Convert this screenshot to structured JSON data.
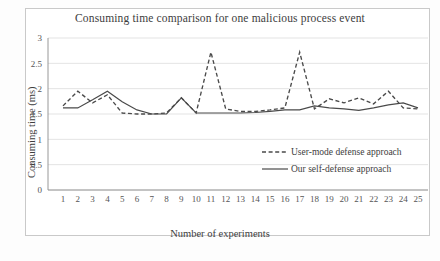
{
  "chart_data": {
    "type": "line",
    "title": "Consuming time comparison for one malicious process event",
    "xlabel": "Number of experiments",
    "ylabel": "Consuming time (ms)",
    "x": [
      1,
      2,
      3,
      4,
      5,
      6,
      7,
      8,
      9,
      10,
      11,
      12,
      13,
      14,
      15,
      16,
      17,
      18,
      19,
      20,
      21,
      22,
      23,
      24,
      25
    ],
    "xticklabels": [
      "1",
      "2",
      "3",
      "4",
      "5",
      "6",
      "7",
      "8",
      "9",
      "10",
      "11",
      "12",
      "13",
      "14",
      "15",
      "16",
      "17",
      "18",
      "19",
      "20",
      "21",
      "22",
      "23",
      "24",
      "25"
    ],
    "yticklabels": [
      "0",
      "0.5",
      "1",
      "1.5",
      "2",
      "2.5",
      "3"
    ],
    "yticks": [
      0,
      0.5,
      1,
      1.5,
      2,
      2.5,
      3
    ],
    "ylim": [
      0,
      3
    ],
    "xlim": [
      1,
      25
    ],
    "grid": "horizontal",
    "legend_position": "center-right",
    "series": [
      {
        "name": "User-mode defense approach",
        "style": "dashed",
        "color": "#4a4a4a",
        "values": [
          1.66,
          1.95,
          1.72,
          1.88,
          1.52,
          1.5,
          1.5,
          1.52,
          1.82,
          1.52,
          2.72,
          1.6,
          1.55,
          1.55,
          1.58,
          1.62,
          2.72,
          1.6,
          1.8,
          1.72,
          1.82,
          1.7,
          1.95,
          1.62,
          1.6
        ]
      },
      {
        "name": "Our self-defense approach",
        "style": "solid",
        "color": "#4a4a4a",
        "values": [
          1.62,
          1.62,
          1.78,
          1.95,
          1.74,
          1.58,
          1.5,
          1.5,
          1.82,
          1.52,
          1.52,
          1.52,
          1.52,
          1.53,
          1.55,
          1.58,
          1.58,
          1.66,
          1.62,
          1.6,
          1.57,
          1.62,
          1.68,
          1.72,
          1.62
        ]
      }
    ]
  },
  "legend": {
    "items": [
      {
        "label": "User-mode defense approach",
        "style": "dashed"
      },
      {
        "label": "Our self-defense approach",
        "style": "solid"
      }
    ]
  }
}
